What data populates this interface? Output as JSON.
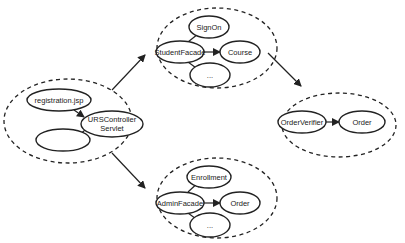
{
  "diagram": {
    "clusters": [
      {
        "id": "web",
        "nodes": [
          "registration.jsp",
          "URSController Servlet",
          ""
        ]
      },
      {
        "id": "student",
        "nodes": [
          "StudentFacade",
          "SignOn",
          "Course",
          "..."
        ]
      },
      {
        "id": "admin",
        "nodes": [
          "AdminFacade",
          "Enrollment",
          "Order",
          "..."
        ]
      },
      {
        "id": "order",
        "nodes": [
          "OrderVerifier",
          "Order"
        ]
      }
    ],
    "labels": {
      "registration": "registration.jsp",
      "urs_line1": "URSController",
      "urs_line2": "Servlet",
      "empty": "",
      "student_facade": "StudentFacade",
      "signon": "SignOn",
      "course": "Course",
      "student_more": "...",
      "admin_facade": "AdminFacade",
      "enrollment": "Enrollment",
      "admin_order": "Order",
      "admin_more": "...",
      "order_verifier": "OrderVerifier",
      "order": "Order"
    },
    "edges": [
      {
        "from": "registration.jsp",
        "to": "URSController Servlet"
      },
      {
        "from": "URSController Servlet",
        "to": ""
      },
      {
        "from": "StudentFacade",
        "to": "SignOn"
      },
      {
        "from": "StudentFacade",
        "to": "Course"
      },
      {
        "from": "StudentFacade",
        "to": "..."
      },
      {
        "from": "AdminFacade",
        "to": "Enrollment"
      },
      {
        "from": "AdminFacade",
        "to": "Order"
      },
      {
        "from": "AdminFacade",
        "to": "..."
      },
      {
        "from": "OrderVerifier",
        "to": "Order"
      },
      {
        "from": "web",
        "to": "student"
      },
      {
        "from": "web",
        "to": "admin"
      },
      {
        "from": "student",
        "to": "order"
      }
    ]
  }
}
